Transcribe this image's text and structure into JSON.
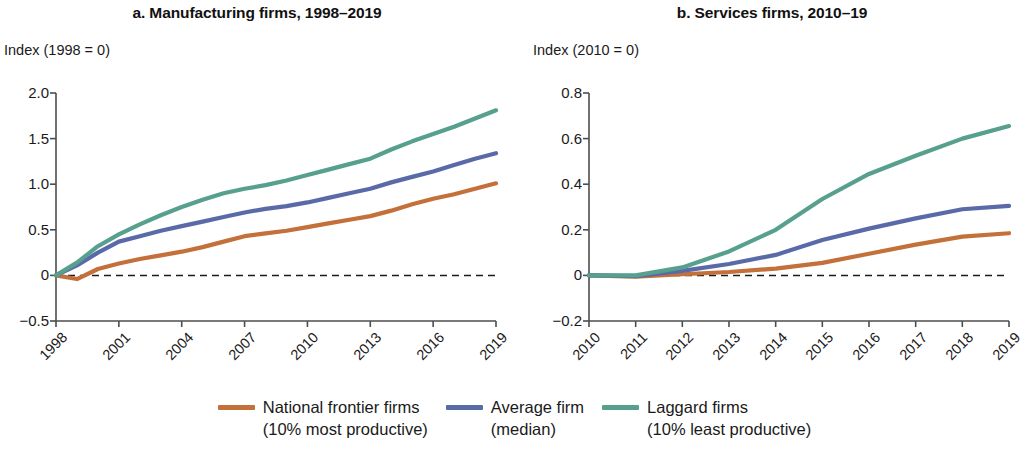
{
  "legend": {
    "items": [
      {
        "label": "National frontier firms",
        "sublabel": "(10% most productive)",
        "color": "#c4703a",
        "key": "frontier"
      },
      {
        "label": "Average firm",
        "sublabel": "(median)",
        "color": "#5a6aa8",
        "key": "average"
      },
      {
        "label": "Laggard firms",
        "sublabel": "(10% least productive)",
        "color": "#56a08d",
        "key": "laggard"
      }
    ]
  },
  "chart_data": [
    {
      "type": "line",
      "id": "panel-a",
      "title": "a. Manufacturing firms, 1998–2019",
      "ylabel": "Index (1998 = 0)",
      "xlabel": "",
      "ylim": [
        -0.5,
        2.0
      ],
      "yticks": [
        2.0,
        1.5,
        1.0,
        0.5,
        0,
        -0.5
      ],
      "ytick_labels": [
        "2.0",
        "1.5",
        "1.0",
        "0.5",
        "0",
        "−0.5"
      ],
      "xlim": [
        1998,
        2019
      ],
      "xticks": [
        1998,
        2001,
        2004,
        2007,
        2010,
        2013,
        2016,
        2019
      ],
      "xtick_labels": [
        "1998",
        "2001",
        "2004",
        "2007",
        "2010",
        "2013",
        "2016",
        "2019"
      ],
      "grid": false,
      "zero_line": true,
      "x": [
        1998,
        1999,
        2000,
        2001,
        2002,
        2003,
        2004,
        2005,
        2006,
        2007,
        2008,
        2009,
        2010,
        2011,
        2012,
        2013,
        2014,
        2015,
        2016,
        2017,
        2018,
        2019
      ],
      "series": [
        {
          "name": "National frontier firms (10% most productive)",
          "color": "#c4703a",
          "values": [
            0,
            -0.04,
            0.07,
            0.13,
            0.18,
            0.22,
            0.26,
            0.31,
            0.37,
            0.43,
            0.46,
            0.49,
            0.53,
            0.57,
            0.61,
            0.65,
            0.71,
            0.78,
            0.84,
            0.89,
            0.95,
            1.01
          ]
        },
        {
          "name": "Average firm (median)",
          "color": "#5a6aa8",
          "values": [
            0,
            0.11,
            0.25,
            0.37,
            0.43,
            0.49,
            0.54,
            0.59,
            0.64,
            0.69,
            0.73,
            0.76,
            0.8,
            0.85,
            0.9,
            0.95,
            1.02,
            1.08,
            1.14,
            1.21,
            1.28,
            1.34
          ]
        },
        {
          "name": "Laggard firms (10% least productive)",
          "color": "#56a08d",
          "values": [
            0,
            0.14,
            0.32,
            0.45,
            0.56,
            0.66,
            0.75,
            0.83,
            0.9,
            0.95,
            0.99,
            1.04,
            1.1,
            1.16,
            1.22,
            1.28,
            1.38,
            1.47,
            1.55,
            1.63,
            1.72,
            1.81
          ]
        }
      ]
    },
    {
      "type": "line",
      "id": "panel-b",
      "title": "b. Services firms, 2010–19",
      "ylabel": "Index (2010 = 0)",
      "xlabel": "",
      "ylim": [
        -0.2,
        0.8
      ],
      "yticks": [
        0.8,
        0.6,
        0.4,
        0.2,
        0,
        -0.2
      ],
      "ytick_labels": [
        "0.8",
        "0.6",
        "0.4",
        "0.2",
        "0",
        "−0.2"
      ],
      "grid": false,
      "zero_line": true,
      "xlim": [
        2010,
        2019
      ],
      "xticks": [
        2010,
        2011,
        2012,
        2013,
        2014,
        2015,
        2016,
        2017,
        2018,
        2019
      ],
      "xtick_labels": [
        "2010",
        "2011",
        "2012",
        "2013",
        "2014",
        "2015",
        "2016",
        "2017",
        "2018",
        "2019"
      ],
      "x": [
        2010,
        2011,
        2012,
        2013,
        2014,
        2015,
        2016,
        2017,
        2018,
        2019
      ],
      "series": [
        {
          "name": "National frontier firms (10% most productive)",
          "color": "#c4703a",
          "values": [
            0,
            -0.005,
            0.005,
            0.015,
            0.03,
            0.055,
            0.095,
            0.135,
            0.17,
            0.185
          ]
        },
        {
          "name": "Average firm (median)",
          "color": "#5a6aa8",
          "values": [
            0,
            -0.003,
            0.02,
            0.05,
            0.09,
            0.155,
            0.205,
            0.25,
            0.29,
            0.305
          ]
        },
        {
          "name": "Laggard firms (10% least productive)",
          "color": "#56a08d",
          "values": [
            0,
            0.0,
            0.035,
            0.105,
            0.2,
            0.335,
            0.445,
            0.525,
            0.6,
            0.655
          ]
        }
      ]
    }
  ]
}
